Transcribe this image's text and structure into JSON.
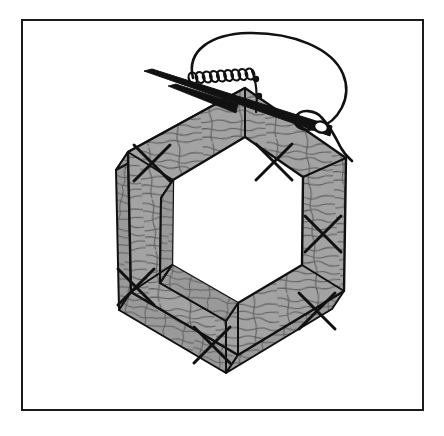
{
  "figure": {
    "type": "patent-line-drawing",
    "caption": "",
    "canvas": {
      "width": 444,
      "height": 436,
      "background": "#ffffff"
    },
    "border": {
      "name": "figure-border-rectangle",
      "x": 22,
      "y": 20,
      "width": 401,
      "height": 390,
      "stroke": "#1a1a1a",
      "stroke_width": 2,
      "fill": "#ffffff"
    },
    "colors": {
      "ink": "#111111",
      "wood_face": "#a3a3a3",
      "wood_side": "#9a9a9a",
      "wood_grain": "#5d5d5d",
      "paper": "#ffffff",
      "thread": "#111111",
      "needle": "#111111"
    },
    "frame": {
      "name": "hexagonal-wood-frame",
      "shape": "hexagon",
      "sides": 6,
      "joint_marks": 6,
      "joint_mark_symbol": "X",
      "outer_vertices": [
        [
          245,
          88
        ],
        [
          346,
          158
        ],
        [
          344,
          291
        ],
        [
          238,
          355
        ],
        [
          131,
          292
        ],
        [
          128,
          152
        ]
      ],
      "inner_vertices": [
        [
          245,
          137
        ],
        [
          303,
          177
        ],
        [
          302,
          265
        ],
        [
          238,
          303
        ],
        [
          172,
          265
        ],
        [
          173,
          180
        ]
      ],
      "depth_offset": [
        -12,
        18
      ],
      "joint_mark_points": [
        [
          152,
          163
        ],
        [
          274,
          162
        ],
        [
          323,
          234
        ],
        [
          317,
          311
        ],
        [
          212,
          345
        ],
        [
          136,
          287
        ]
      ]
    },
    "needle": {
      "name": "sewing-needle",
      "tip": [
        144,
        71
      ],
      "eye": [
        328,
        131
      ],
      "body_width": 7,
      "has_eye": true
    },
    "thread": {
      "name": "sewing-thread",
      "loop_description": "large open loop of thread rising above the frame and returning to the needle eye",
      "tail_end": [
        352,
        161
      ],
      "stitch_count": 9,
      "stitch_start": [
        193,
        78
      ],
      "stitch_end": [
        250,
        74
      ]
    }
  }
}
